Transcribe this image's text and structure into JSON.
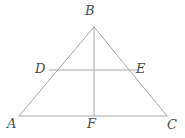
{
  "figure": {
    "type": "geometry-diagram",
    "shape": "triangle",
    "stroke_color": "#a8a8a8",
    "label_color": "#4a4a4a",
    "background_color": "#ffffff",
    "stroke_width": 1,
    "points": {
      "A": {
        "label": "A",
        "x": 19,
        "y": 116
      },
      "B": {
        "label": "B",
        "x": 94,
        "y": 27
      },
      "C": {
        "label": "C",
        "x": 167,
        "y": 116
      },
      "D": {
        "label": "D",
        "x": 49,
        "y": 70
      },
      "E": {
        "label": "E",
        "x": 138,
        "y": 70
      },
      "F": {
        "label": "F",
        "x": 94,
        "y": 116
      }
    },
    "segments": [
      {
        "name": "AB",
        "from": "A",
        "to": "B"
      },
      {
        "name": "BC",
        "from": "B",
        "to": "C"
      },
      {
        "name": "AC",
        "from": "A",
        "to": "C"
      },
      {
        "name": "BF",
        "from": "B",
        "to": "F"
      },
      {
        "name": "DE",
        "from": "D",
        "to": "E"
      }
    ]
  }
}
